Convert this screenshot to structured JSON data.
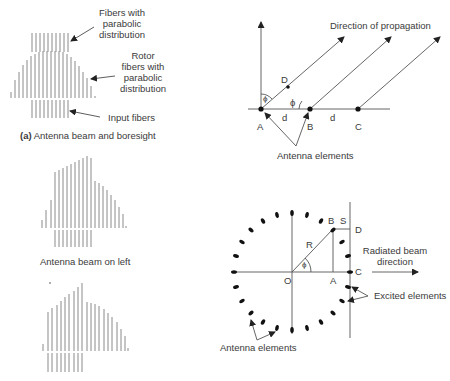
{
  "panel_a": {
    "label_fibers_parabolic": [
      "Fibers with",
      "parabolic",
      "distribution"
    ],
    "label_rotor": [
      "Rotor",
      "fibers with",
      "parabolic",
      "distribution"
    ],
    "label_input": "Input fibers",
    "caption_letter": "(a)",
    "caption_text": "Antenna beam and boresight"
  },
  "panel_left_beam": {
    "caption": "Antenna beam on left"
  },
  "linear_array": {
    "title": "Direction of propagation",
    "points": {
      "A": "A",
      "B": "B",
      "C": "C",
      "D": "D"
    },
    "spacing": "d",
    "angle": "ϕ",
    "elements_label": "Antenna elements"
  },
  "circular_array": {
    "labels": {
      "O": "O",
      "A": "A",
      "B": "B",
      "C": "C",
      "D": "D",
      "S": "S",
      "R": "R",
      "phi": "ϕ"
    },
    "beam_label": [
      "Radiated beam",
      "direction"
    ],
    "excited_label": "Excited elements",
    "elements_label": "Antenna elements",
    "element_count": 24
  },
  "colors": {
    "line": "#555555",
    "fiber": "#8a8a8a",
    "dot": "#111111",
    "text": "#3a3a3a"
  }
}
